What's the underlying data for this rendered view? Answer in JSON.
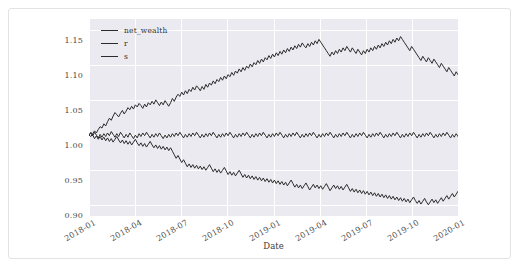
{
  "card": {
    "background": "#ffffff",
    "border_color": "#e3e3e5"
  },
  "chart_data": {
    "type": "line",
    "title": "",
    "xlabel": "Date",
    "ylabel": "",
    "grid": true,
    "legend_position": "upper left",
    "plot_background": "#eaeaf0",
    "gridline_color": "#ffffff",
    "line_color": "#2b2b2b",
    "ylim": [
      0.885,
      1.165
    ],
    "yticks": [
      0.9,
      0.95,
      1.0,
      1.05,
      1.1,
      1.15
    ],
    "ytick_labels": [
      "0.90",
      "0.95",
      "1.00",
      "1.05",
      "1.10",
      "1.15"
    ],
    "xlim": [
      "2018-01",
      "2020-02"
    ],
    "xticks": [
      "2018-01",
      "2018-04",
      "2018-07",
      "2018-10",
      "2019-01",
      "2019-04",
      "2019-07",
      "2019-10",
      "2020-01"
    ],
    "xtick_labels": [
      "2018-01",
      "2018-04",
      "2018-07",
      "2018-10",
      "2019-01",
      "2019-04",
      "2019-07",
      "2019-10",
      "2020-01"
    ],
    "legend": [
      "net_wealth",
      "r",
      "s"
    ],
    "series": [
      {
        "name": "net_wealth",
        "color": "#2b2b2b",
        "values": [
          1.0,
          0.998,
          1.002,
          1.006,
          1.003,
          1.008,
          1.012,
          1.01,
          1.016,
          1.013,
          1.019,
          1.024,
          1.021,
          1.027,
          1.032,
          1.029,
          1.026,
          1.031,
          1.035,
          1.03,
          1.034,
          1.039,
          1.036,
          1.041,
          1.037,
          1.043,
          1.04,
          1.045,
          1.042,
          1.038,
          1.044,
          1.04,
          1.046,
          1.043,
          1.048,
          1.044,
          1.05,
          1.046,
          1.042,
          1.047,
          1.043,
          1.049,
          1.045,
          1.041,
          1.046,
          1.052,
          1.048,
          1.054,
          1.058,
          1.055,
          1.061,
          1.057,
          1.063,
          1.059,
          1.065,
          1.062,
          1.068,
          1.064,
          1.07,
          1.067,
          1.063,
          1.069,
          1.065,
          1.072,
          1.068,
          1.074,
          1.071,
          1.077,
          1.073,
          1.079,
          1.076,
          1.082,
          1.078,
          1.084,
          1.08,
          1.086,
          1.083,
          1.089,
          1.085,
          1.091,
          1.088,
          1.094,
          1.09,
          1.096,
          1.092,
          1.098,
          1.095,
          1.101,
          1.097,
          1.103,
          1.1,
          1.106,
          1.102,
          1.108,
          1.104,
          1.11,
          1.107,
          1.113,
          1.109,
          1.115,
          1.111,
          1.117,
          1.113,
          1.119,
          1.115,
          1.121,
          1.117,
          1.123,
          1.119,
          1.125,
          1.121,
          1.127,
          1.123,
          1.129,
          1.125,
          1.131,
          1.127,
          1.124,
          1.13,
          1.126,
          1.132,
          1.128,
          1.134,
          1.13,
          1.136,
          1.132,
          1.128,
          1.124,
          1.12,
          1.116,
          1.112,
          1.118,
          1.114,
          1.12,
          1.116,
          1.122,
          1.118,
          1.124,
          1.12,
          1.126,
          1.122,
          1.118,
          1.124,
          1.12,
          1.116,
          1.122,
          1.118,
          1.114,
          1.12,
          1.116,
          1.122,
          1.118,
          1.124,
          1.12,
          1.126,
          1.122,
          1.128,
          1.124,
          1.13,
          1.126,
          1.132,
          1.128,
          1.134,
          1.13,
          1.136,
          1.132,
          1.138,
          1.134,
          1.14,
          1.136,
          1.132,
          1.128,
          1.124,
          1.12,
          1.126,
          1.122,
          1.118,
          1.114,
          1.11,
          1.106,
          1.112,
          1.108,
          1.104,
          1.11,
          1.106,
          1.102,
          1.108,
          1.104,
          1.1,
          1.096,
          1.102,
          1.098,
          1.094,
          1.09,
          1.096,
          1.092,
          1.088,
          1.084,
          1.09,
          1.086
        ]
      },
      {
        "name": "r",
        "color": "#2b2b2b",
        "values": [
          1.0,
          1.003,
          0.999,
          1.004,
          1.0,
          0.996,
          1.001,
          0.997,
          1.002,
          0.998,
          1.003,
          0.999,
          1.005,
          1.001,
          0.997,
          1.002,
          0.998,
          1.004,
          1.0,
          0.996,
          1.001,
          0.997,
          1.003,
          0.999,
          0.995,
          1.0,
          0.996,
          1.002,
          0.998,
          1.003,
          0.999,
          1.004,
          1.0,
          0.996,
          1.001,
          0.997,
          1.002,
          0.998,
          1.003,
          0.999,
          0.995,
          1.0,
          0.996,
          1.001,
          0.997,
          1.002,
          0.998,
          1.003,
          0.999,
          1.004,
          1.0,
          0.996,
          1.001,
          0.997,
          1.002,
          0.998,
          1.003,
          0.999,
          1.004,
          1.0,
          0.996,
          1.001,
          0.997,
          1.002,
          0.998,
          1.003,
          0.999,
          1.004,
          1.0,
          0.996,
          1.001,
          0.997,
          1.002,
          0.998,
          1.003,
          0.999,
          1.004,
          1.0,
          0.996,
          1.001,
          0.997,
          1.002,
          0.998,
          1.003,
          0.999,
          1.004,
          1.0,
          0.996,
          1.001,
          0.997,
          1.002,
          0.998,
          1.003,
          0.999,
          1.004,
          1.0,
          0.996,
          1.001,
          0.997,
          1.002,
          0.998,
          1.003,
          0.999,
          1.004,
          1.0,
          0.996,
          1.001,
          0.997,
          1.002,
          0.998,
          1.003,
          0.999,
          1.004,
          1.0,
          0.996,
          1.001,
          0.997,
          1.002,
          0.998,
          1.003,
          0.999,
          1.004,
          1.0,
          0.996,
          1.001,
          0.997,
          1.002,
          0.998,
          1.003,
          0.999,
          1.004,
          1.0,
          0.996,
          1.001,
          0.997,
          1.002,
          0.998,
          1.003,
          0.999,
          1.004,
          1.0,
          0.996,
          1.001,
          0.997,
          1.002,
          0.998,
          1.003,
          0.999,
          1.004,
          1.0,
          0.996,
          1.001,
          0.997,
          1.002,
          0.998,
          1.003,
          0.999,
          1.004,
          1.0,
          0.996,
          1.001,
          0.997,
          1.002,
          0.998,
          1.003,
          0.999,
          1.004,
          1.0,
          0.996,
          1.001,
          0.997,
          1.002,
          0.998,
          1.003,
          0.999,
          1.004,
          1.0,
          0.996,
          1.001,
          0.997,
          1.002,
          0.998,
          1.003,
          0.999,
          1.004,
          1.0,
          0.996,
          1.001,
          0.997,
          1.002,
          0.998,
          1.003,
          0.999,
          1.004,
          1.0,
          0.996,
          1.001,
          0.997,
          1.002,
          0.998
        ]
      },
      {
        "name": "s",
        "color": "#2b2b2b",
        "values": [
          1.0,
          1.004,
          1.0,
          0.995,
          0.999,
          0.994,
          0.998,
          0.993,
          0.997,
          0.992,
          0.996,
          0.991,
          0.995,
          0.99,
          0.994,
          0.998,
          0.993,
          0.989,
          0.993,
          0.988,
          0.992,
          0.987,
          0.991,
          0.986,
          0.99,
          0.994,
          0.989,
          0.985,
          0.989,
          0.984,
          0.988,
          0.983,
          0.987,
          0.991,
          0.986,
          0.982,
          0.986,
          0.981,
          0.985,
          0.98,
          0.984,
          0.979,
          0.983,
          0.978,
          0.982,
          0.977,
          0.972,
          0.967,
          0.971,
          0.966,
          0.961,
          0.965,
          0.96,
          0.955,
          0.959,
          0.954,
          0.958,
          0.953,
          0.957,
          0.952,
          0.956,
          0.951,
          0.955,
          0.95,
          0.954,
          0.958,
          0.953,
          0.948,
          0.952,
          0.947,
          0.951,
          0.946,
          0.95,
          0.954,
          0.949,
          0.944,
          0.948,
          0.943,
          0.947,
          0.942,
          0.946,
          0.95,
          0.945,
          0.94,
          0.944,
          0.939,
          0.943,
          0.938,
          0.942,
          0.937,
          0.941,
          0.936,
          0.94,
          0.935,
          0.939,
          0.934,
          0.938,
          0.933,
          0.937,
          0.932,
          0.936,
          0.931,
          0.935,
          0.93,
          0.934,
          0.929,
          0.933,
          0.928,
          0.932,
          0.936,
          0.931,
          0.926,
          0.93,
          0.925,
          0.929,
          0.924,
          0.928,
          0.932,
          0.927,
          0.922,
          0.926,
          0.93,
          0.925,
          0.929,
          0.924,
          0.928,
          0.923,
          0.927,
          0.931,
          0.926,
          0.921,
          0.925,
          0.929,
          0.924,
          0.928,
          0.923,
          0.927,
          0.922,
          0.926,
          0.93,
          0.925,
          0.92,
          0.924,
          0.919,
          0.923,
          0.918,
          0.922,
          0.917,
          0.921,
          0.916,
          0.92,
          0.915,
          0.919,
          0.914,
          0.918,
          0.913,
          0.917,
          0.912,
          0.916,
          0.911,
          0.915,
          0.91,
          0.914,
          0.909,
          0.913,
          0.908,
          0.912,
          0.907,
          0.911,
          0.906,
          0.91,
          0.905,
          0.909,
          0.904,
          0.908,
          0.912,
          0.907,
          0.903,
          0.907,
          0.902,
          0.906,
          0.91,
          0.905,
          0.901,
          0.905,
          0.909,
          0.904,
          0.908,
          0.903,
          0.907,
          0.911,
          0.906,
          0.91,
          0.914,
          0.909,
          0.913,
          0.917,
          0.912,
          0.916,
          0.92
        ]
      }
    ]
  }
}
